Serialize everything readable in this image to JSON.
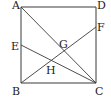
{
  "diagram": {
    "type": "geometry-square-with-lines",
    "colors": {
      "line": "#3a3a3a",
      "label": "#222222",
      "background": "#ffffff"
    },
    "points": {
      "A": {
        "label": "A",
        "x": 21,
        "y": 7
      },
      "D": {
        "label": "D",
        "x": 96,
        "y": 7
      },
      "B": {
        "label": "B",
        "x": 21,
        "y": 83
      },
      "C": {
        "label": "C",
        "x": 96,
        "y": 83
      },
      "E": {
        "label": "E",
        "x": 21,
        "y": 45
      },
      "F": {
        "label": "F",
        "x": 96,
        "y": 27
      },
      "G": {
        "label": "G",
        "x": 64,
        "y": 51
      },
      "H": {
        "label": "H",
        "x": 51,
        "y": 60
      }
    },
    "segments": [
      {
        "from": "A",
        "to": "D"
      },
      {
        "from": "D",
        "to": "C"
      },
      {
        "from": "C",
        "to": "B"
      },
      {
        "from": "B",
        "to": "A"
      },
      {
        "from": "A",
        "to": "C"
      },
      {
        "from": "B",
        "to": "F"
      },
      {
        "from": "E",
        "to": "C"
      }
    ],
    "labels": {
      "A": "A",
      "B": "B",
      "C": "C",
      "D": "D",
      "E": "E",
      "F": "F",
      "G": "G",
      "H": "H"
    }
  }
}
